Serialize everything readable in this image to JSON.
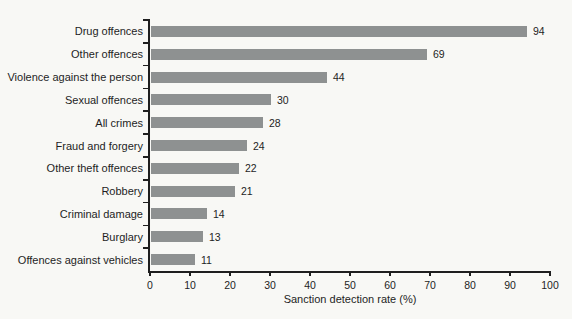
{
  "figure": {
    "background_color": "#f8f8f5",
    "bar_color": "#8e9191",
    "axis_color": "#1e1e1e",
    "text_color": "#1e1e1e"
  },
  "chart_data": {
    "type": "bar",
    "orientation": "horizontal",
    "categories": [
      "Drug offences",
      "Other offences",
      "Violence against the person",
      "Sexual offences",
      "All crimes",
      "Fraud and forgery",
      "Other theft offences",
      "Robbery",
      "Criminal damage",
      "Burglary",
      "Offences against vehicles"
    ],
    "values": [
      94,
      69,
      44,
      30,
      28,
      24,
      22,
      21,
      14,
      13,
      11
    ],
    "value_labels": [
      "94",
      "69",
      "44",
      "30",
      "28",
      "24",
      "22",
      "21",
      "14",
      "13",
      "11"
    ],
    "title": "",
    "xlabel": "Sanction detection rate (%)",
    "ylabel": "",
    "xlim": [
      0,
      100
    ],
    "x_ticks": [
      0,
      10,
      20,
      30,
      40,
      50,
      60,
      70,
      80,
      90,
      100
    ],
    "x_tick_labels": [
      "0",
      "10",
      "20",
      "30",
      "40",
      "50",
      "60",
      "70",
      "80",
      "90",
      "100"
    ],
    "grid": false,
    "legend": "none",
    "value_labels_shown": true
  }
}
